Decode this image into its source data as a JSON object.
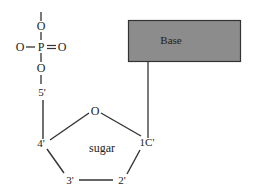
{
  "diagram": {
    "phosphate": {
      "top_o": "O",
      "p": "P",
      "left_o": "O",
      "right_o": "O",
      "bottom_o": "O"
    },
    "carbons": {
      "c5": "5'",
      "c4": "4'",
      "c3": "3'",
      "c2": "2'",
      "c1": "1C'"
    },
    "ring_o": "O",
    "sugar_label": "sugar",
    "base_label": "Base",
    "colors": {
      "base_fill": "#8c8c8c",
      "base_stroke": "#333333",
      "line": "#333333",
      "text": "#222222"
    }
  }
}
